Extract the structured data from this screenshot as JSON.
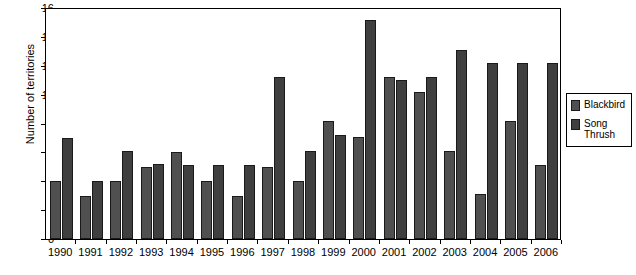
{
  "chart_data": {
    "type": "bar",
    "title": "",
    "xlabel": "",
    "ylabel": "Number of territories",
    "ylim": [
      0,
      16
    ],
    "ytick_step": 2,
    "yticks": [
      "0",
      "2",
      "4",
      "6",
      "8",
      "10",
      "12",
      "14",
      "16"
    ],
    "grid": false,
    "legend_position": "right",
    "categories": [
      "1990",
      "1991",
      "1992",
      "1993",
      "1994",
      "1995",
      "1996",
      "1997",
      "1998",
      "1999",
      "2000",
      "2001",
      "2002",
      "2003",
      "2004",
      "2005",
      "2006"
    ],
    "series": [
      {
        "name": "Blackbird",
        "values": [
          4,
          3,
          4,
          5,
          6,
          4,
          3,
          5,
          4,
          8.2,
          7.1,
          11.2,
          10.2,
          6.1,
          3.1,
          8.2,
          5.1
        ]
      },
      {
        "name": "Song Thrush",
        "values": [
          7,
          4,
          6.1,
          5.2,
          5.1,
          5.1,
          5.1,
          11.2,
          6.1,
          7.2,
          15.2,
          11,
          11.2,
          13.1,
          12.2,
          12.2,
          12.2
        ]
      }
    ]
  },
  "legend": {
    "items": [
      {
        "label": "Blackbird",
        "color": "#505050"
      },
      {
        "label": "Song\nThrush",
        "color": "#3f3f3f"
      }
    ]
  },
  "axes": {
    "y_title": "Number of territories"
  }
}
